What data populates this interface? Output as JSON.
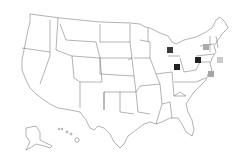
{
  "map": {
    "type": "us-states-outline",
    "background": "#ffffff",
    "outline_color": "#555555",
    "markers": [
      {
        "region": "Michigan",
        "x": 167,
        "y": 47,
        "color": "#3a3a3a",
        "shade": "dark"
      },
      {
        "region": "Ohio",
        "x": 174,
        "y": 64,
        "color": "#222222",
        "shade": "dark"
      },
      {
        "region": "Pennsylvania",
        "x": 195,
        "y": 57,
        "color": "#222222",
        "shade": "dark"
      },
      {
        "region": "New York",
        "x": 203,
        "y": 44,
        "color": "#aaaaaa",
        "shade": "light"
      },
      {
        "region": "Connecticut / Rhode Island area",
        "x": 217,
        "y": 57,
        "color": "#cccccc",
        "shade": "light"
      },
      {
        "region": "Delaware / Maryland area",
        "x": 208,
        "y": 71,
        "color": "#a6a6a6",
        "shade": "light"
      }
    ]
  }
}
